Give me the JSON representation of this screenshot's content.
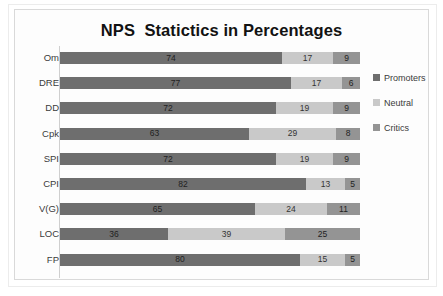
{
  "chart_data": {
    "type": "bar",
    "orientation": "horizontal",
    "stacked": true,
    "stack_mode": "percent",
    "title": "NPS  Statictics in Percentages",
    "xlabel": "",
    "ylabel": "",
    "xlim": [
      0,
      100
    ],
    "grid": false,
    "legend_position": "right",
    "categories": [
      "Om",
      "DRE",
      "DD",
      "Cpk",
      "SPI",
      "CPI",
      "V(G)",
      "LOC",
      "FP"
    ],
    "series": [
      {
        "name": "Promoters",
        "color": "#6e6e6e",
        "values": [
          74,
          77,
          72,
          63,
          72,
          82,
          65,
          36,
          80
        ]
      },
      {
        "name": "Neutral",
        "color": "#c9c9c9",
        "values": [
          17,
          17,
          19,
          29,
          19,
          13,
          24,
          39,
          15
        ]
      },
      {
        "name": "Critics",
        "color": "#949494",
        "values": [
          9,
          6,
          9,
          8,
          9,
          5,
          11,
          25,
          5
        ]
      }
    ]
  },
  "legend": {
    "items": [
      {
        "label": "Promoters",
        "color": "#6e6e6e"
      },
      {
        "label": "Neutral",
        "color": "#c9c9c9"
      },
      {
        "label": "Critics",
        "color": "#949494"
      }
    ]
  },
  "colors": {
    "promoters": "#6e6e6e",
    "neutral": "#c9c9c9",
    "critics": "#949494",
    "frame_border": "#d9d9d9",
    "plot_background": "#fdfdfd",
    "title_text": "#121212",
    "axis_text": "#3b3b3b"
  }
}
